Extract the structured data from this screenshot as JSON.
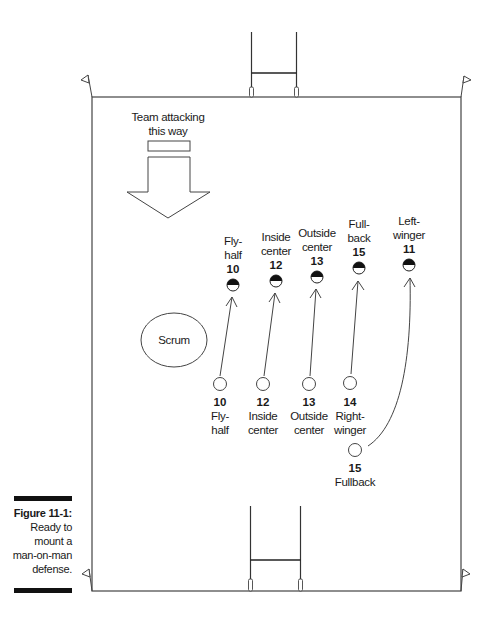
{
  "figure": {
    "caption_title": "Figure 11-1:",
    "caption_lines": [
      "Ready to",
      "mount a",
      "man-on-man",
      "defense."
    ]
  },
  "field": {
    "attack_label_lines": [
      "Team attacking",
      "this way"
    ],
    "scrum_label": "Scrum"
  },
  "defenders": [
    {
      "name_lines": [
        "Fly-",
        "half"
      ],
      "number": "10"
    },
    {
      "name_lines": [
        "Inside",
        "center"
      ],
      "number": "12"
    },
    {
      "name_lines": [
        "Outside",
        "center"
      ],
      "number": "13"
    },
    {
      "name_lines": [
        "Full-",
        "back"
      ],
      "number": "15"
    },
    {
      "name_lines": [
        "Left-",
        "winger"
      ],
      "number": "11"
    }
  ],
  "attackers": [
    {
      "number": "10",
      "name_lines": [
        "Fly-",
        "half"
      ]
    },
    {
      "number": "12",
      "name_lines": [
        "Inside",
        "center"
      ]
    },
    {
      "number": "13",
      "name_lines": [
        "Outside",
        "center"
      ]
    },
    {
      "number": "14",
      "name_lines": [
        "Right-",
        "winger"
      ]
    },
    {
      "number": "15",
      "name_lines": [
        "Fullback"
      ]
    }
  ]
}
